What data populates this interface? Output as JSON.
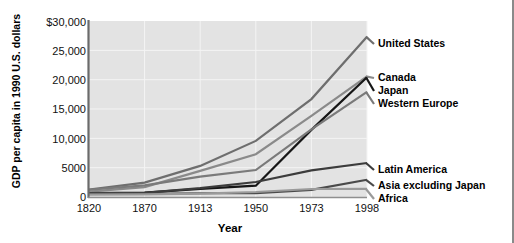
{
  "chart_data": {
    "type": "line",
    "title": "",
    "xlabel": "Year",
    "ylabel": "GDP per capita in 1990 U.S. dollars",
    "x": [
      1820,
      1870,
      1913,
      1950,
      1973,
      1998
    ],
    "xtick_labels": [
      "1820",
      "1870",
      "1913",
      "1950",
      "1973",
      "1998"
    ],
    "ytick_labels": [
      "$30,000",
      "25,000",
      "20,000",
      "15,000",
      "10,000",
      "5000",
      "0"
    ],
    "ytick_values": [
      30000,
      25000,
      20000,
      15000,
      10000,
      5000,
      0
    ],
    "ylim": [
      0,
      30000
    ],
    "grid": true,
    "legend_position": "right-of-lines",
    "series": [
      {
        "name": "United States",
        "color": "#6e6e6e",
        "values": [
          1257,
          2445,
          5301,
          9561,
          16689,
          27331
        ]
      },
      {
        "name": "Canada",
        "color": "#8a8a8a",
        "values": [
          904,
          1695,
          4447,
          7291,
          13838,
          20559
        ]
      },
      {
        "name": "Japan",
        "color": "#161616",
        "values": [
          669,
          737,
          1387,
          1926,
          11439,
          20410
        ]
      },
      {
        "name": "Western Europe",
        "color": "#7a7a7a",
        "values": [
          1232,
          1974,
          3473,
          4594,
          11534,
          17921
        ]
      },
      {
        "name": "Latin America",
        "color": "#3c3c3c",
        "values": [
          665,
          698,
          1511,
          2554,
          4531,
          5795
        ]
      },
      {
        "name": "Asia excluding Japan",
        "color": "#4a4a4a",
        "values": [
          575,
          543,
          640,
          635,
          1212,
          2936
        ]
      },
      {
        "name": "Africa",
        "color": "#9a9a9a",
        "values": [
          418,
          444,
          585,
          852,
          1365,
          1368
        ]
      }
    ]
  },
  "axis": {
    "ylabel_title": "GDP per capita in 1990 U.S. dollars",
    "xlabel_title": "Year",
    "yticks": [
      "$30,000",
      "25,000",
      "20,000",
      "15,000",
      "10,000",
      "5000",
      "0"
    ],
    "xticks": [
      "1820",
      "1870",
      "1913",
      "1950",
      "1973",
      "1998"
    ]
  },
  "legend": {
    "items": [
      "United States",
      "Canada",
      "Japan",
      "Western Europe",
      "Latin America",
      "Asia excluding Japan",
      "Africa"
    ]
  },
  "colors": {
    "plot_background": "#e3e3e3",
    "grid": "#f4f4f4",
    "axis": "#6b6b6b",
    "text": "#111111",
    "page_background": "#ffffff"
  }
}
